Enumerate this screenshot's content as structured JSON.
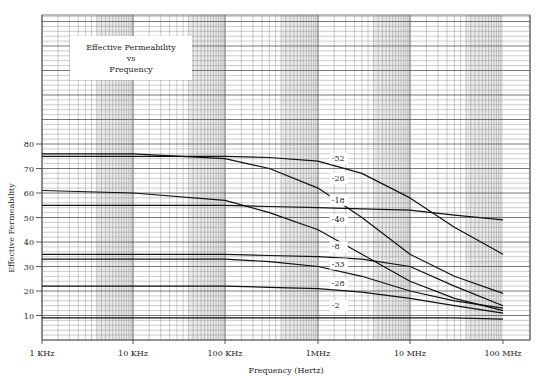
{
  "chart_data": {
    "type": "line",
    "title": "Effective Permeability vs Frequency",
    "title_lines": [
      "Effective Permeability",
      "vs",
      "Frequency"
    ],
    "xlabel": "Frequency (Hertz)",
    "ylabel": "Effective Permeability",
    "x_scale": "log",
    "x_ticks": [
      {
        "value": 1000,
        "label": "1 KHz"
      },
      {
        "value": 10000,
        "label": "10 KHz"
      },
      {
        "value": 100000,
        "label": "100 KHz"
      },
      {
        "value": 1000000,
        "label": "1MHz"
      },
      {
        "value": 10000000,
        "label": "10 MHz"
      },
      {
        "value": 100000000,
        "label": "100 MHz"
      }
    ],
    "y_ticks": [
      10,
      20,
      30,
      40,
      50,
      60,
      70,
      80
    ],
    "xlim": [
      1000,
      100000000
    ],
    "ylim": [
      0,
      132
    ],
    "grid": true,
    "legend": "inline curve labels near 1-10 MHz",
    "x": [
      1000,
      10000,
      100000,
      300000,
      1000000,
      3000000,
      10000000,
      30000000,
      100000000
    ],
    "series": [
      {
        "name": "-52",
        "values": [
          75,
          75,
          75,
          74.5,
          73,
          68,
          58,
          46,
          35
        ]
      },
      {
        "name": "-26",
        "values": [
          76,
          76,
          74,
          70,
          62,
          50,
          35,
          26,
          19
        ]
      },
      {
        "name": "-18",
        "values": [
          55,
          55,
          55,
          54.5,
          54,
          53.5,
          53,
          51,
          49
        ]
      },
      {
        "name": "-40",
        "values": [
          61,
          60,
          57,
          52,
          45,
          35,
          24,
          17,
          12
        ]
      },
      {
        "name": "-8",
        "values": [
          35,
          35,
          35,
          34.5,
          34,
          33,
          30,
          22,
          14
        ]
      },
      {
        "name": "-33",
        "values": [
          33,
          33,
          33,
          32,
          30,
          26,
          20,
          16,
          13
        ]
      },
      {
        "name": "-28",
        "values": [
          22,
          22,
          22,
          21.5,
          21,
          19.5,
          17,
          14,
          11
        ]
      },
      {
        "name": "-2",
        "values": [
          9,
          9,
          9,
          9,
          9,
          9,
          9,
          9,
          8.5
        ]
      }
    ],
    "curve_labels": [
      {
        "text": "-52",
        "x": 2000000,
        "y": 73
      },
      {
        "text": "-26",
        "x": 2000000,
        "y": 65
      },
      {
        "text": "-18",
        "x": 2000000,
        "y": 56
      },
      {
        "text": "-40",
        "x": 2000000,
        "y": 48
      },
      {
        "text": "-8",
        "x": 2000000,
        "y": 37
      },
      {
        "text": "-33",
        "x": 2000000,
        "y": 30
      },
      {
        "text": "-28",
        "x": 2000000,
        "y": 22
      },
      {
        "text": "-2",
        "x": 2000000,
        "y": 13
      }
    ]
  },
  "plot": {
    "left": 42,
    "right": 530,
    "top": 15,
    "bottom": 340,
    "x_decade_px": [
      42,
      133,
      225,
      318,
      410,
      503
    ],
    "y_px_per_unit": 2.45,
    "colors": {
      "grid": "#8a8a8a",
      "grid_major": "#555555",
      "curve": "#111111",
      "band": "#9a9a9a"
    }
  }
}
